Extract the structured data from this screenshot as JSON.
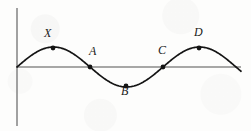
{
  "figure": {
    "background_color": "#fdfdfc",
    "curve_color": "#141414",
    "axis_color": "#8a8a8a",
    "point_color": "#141414"
  },
  "labels": {
    "x": "X",
    "a": "A",
    "b": "B",
    "c": "C",
    "d": "D"
  },
  "chart_data": {
    "type": "line",
    "title": "",
    "xlabel": "",
    "ylabel": "",
    "grid": false,
    "legend": "none",
    "axes": {
      "x_axis_y_px": 67,
      "x_axis_start_px": 17,
      "x_axis_end_px": 241,
      "y_axis_x_px": 17,
      "y_axis_top_px": 8,
      "y_axis_bottom_px": 126
    },
    "curve": {
      "shape": "sine",
      "amplitude_px": 20,
      "period_px": 146,
      "start_x_px": 17,
      "end_x_px": 241,
      "description": "One full sine cycle plus partial, starting at origin rising to a crest, through a trough, to a second crest, then descending to the axis"
    },
    "points": [
      {
        "label": "X",
        "x_px": 53,
        "y_px": 48,
        "location": "first crest",
        "label_dx": -5,
        "label_dy": -14
      },
      {
        "label": "A",
        "x_px": 90,
        "y_px": 67,
        "location": "descending zero crossing",
        "label_dx": 3,
        "label_dy": -15
      },
      {
        "label": "B",
        "x_px": 126,
        "y_px": 86,
        "location": "trough",
        "label_dx": -1,
        "label_dy": 6
      },
      {
        "label": "C",
        "x_px": 163,
        "y_px": 67,
        "location": "ascending zero crossing",
        "label_dx": -1,
        "label_dy": -16
      },
      {
        "label": "D",
        "x_px": 199,
        "y_px": 48,
        "location": "second crest",
        "label_dx": -1,
        "label_dy": -15
      }
    ]
  }
}
